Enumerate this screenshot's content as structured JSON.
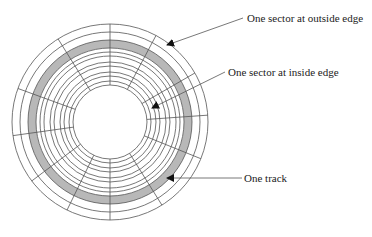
{
  "diagram": {
    "center": [
      110,
      122
    ],
    "inner_hole_radius": 37,
    "track_radii": [
      37,
      41,
      46,
      50,
      56,
      60,
      66,
      70,
      74,
      82,
      90,
      98
    ],
    "highlighted_track": {
      "inner_radius": 74,
      "outer_radius": 82,
      "fill": "#b8b8b8"
    },
    "sector_spoke_angles_deg": [
      270,
      298,
      330,
      356,
      22,
      58,
      90,
      116,
      143,
      172,
      200,
      238
    ],
    "line_color": "#555555",
    "annotations": [
      {
        "id": "outside-sector",
        "text": "One sector at outside edge",
        "text_pos": [
          247,
          22
        ],
        "arrow_from": [
          243,
          18
        ],
        "arrow_to": [
          167,
          45
        ]
      },
      {
        "id": "inside-sector",
        "text": "One sector at inside edge",
        "text_pos": [
          228,
          76
        ],
        "arrow_from": [
          225,
          72
        ],
        "arrow_to": [
          152,
          108
        ]
      },
      {
        "id": "track",
        "text": "One track",
        "text_pos": [
          244,
          182
        ],
        "arrow_from": [
          242,
          178
        ],
        "arrow_to": [
          167,
          178
        ]
      }
    ]
  }
}
